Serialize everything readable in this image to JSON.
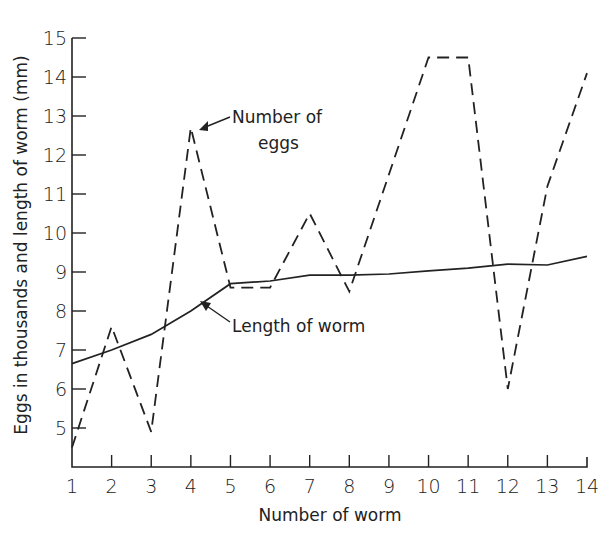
{
  "chart_data": {
    "type": "line",
    "title": "",
    "xlabel": "Number of worm",
    "ylabel": "Eggs in thousands and length of worm (mm)",
    "x": [
      1,
      2,
      3,
      4,
      5,
      6,
      7,
      8,
      9,
      10,
      11,
      12,
      13,
      14
    ],
    "xticks": [
      "1",
      "2",
      "3",
      "4",
      "5",
      "6",
      "7",
      "8",
      "9",
      "10",
      "11",
      "12",
      "13",
      "14"
    ],
    "yticks": [
      "5",
      "6",
      "7",
      "8",
      "9",
      "10",
      "11",
      "12",
      "13",
      "14",
      "15"
    ],
    "xlim": [
      1,
      14
    ],
    "ylim": [
      4,
      15
    ],
    "grid": false,
    "legend": "none (inline annotations with arrows)",
    "series": [
      {
        "name": "Number of eggs",
        "style": "dashed",
        "values": [
          4.5,
          7.6,
          4.9,
          12.7,
          8.6,
          8.6,
          10.5,
          8.5,
          11.5,
          14.5,
          14.5,
          6.0,
          11.2,
          14.1
        ]
      },
      {
        "name": "Length of worm",
        "style": "solid",
        "values": [
          6.65,
          7.0,
          7.4,
          8.0,
          8.7,
          8.77,
          8.92,
          8.92,
          8.95,
          9.03,
          9.1,
          9.2,
          9.18,
          9.4
        ]
      }
    ],
    "annotations": [
      {
        "text_lines": [
          "Number of",
          "eggs"
        ],
        "points_to": {
          "series": "Number of eggs",
          "x": 4
        }
      },
      {
        "text_lines": [
          "Length of worm"
        ],
        "points_to": {
          "series": "Length of worm",
          "x": 4
        }
      }
    ]
  },
  "labels": {
    "xlabel": "Number of worm",
    "ylabel": "Eggs in thousands and length of worm (mm)",
    "eggs_annotation_line1": "Number of",
    "eggs_annotation_line2": "eggs",
    "length_annotation": "Length of worm"
  },
  "colors": {
    "ink": "#222222",
    "background": "#ffffff"
  }
}
